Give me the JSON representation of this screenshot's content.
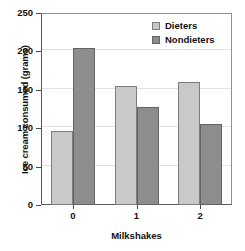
{
  "chart_data": {
    "type": "bar",
    "title": "",
    "subtitle": "",
    "xlabel": "Milkshakes",
    "ylabel": "Ice cream consumed (grams)",
    "categories": [
      "0",
      "1",
      "2"
    ],
    "series": [
      {
        "name": "Dieters",
        "color": "#c9c9c9",
        "values": [
          96,
          155,
          160
        ]
      },
      {
        "name": "Nondieters",
        "color": "#8d8d8d",
        "values": [
          205,
          128,
          105
        ]
      }
    ],
    "ylim": [
      0,
      250
    ],
    "yticks": [
      0,
      50,
      100,
      150,
      200,
      250
    ],
    "ytick_labels": [
      "0",
      "50",
      "100",
      "150",
      "200",
      "250"
    ],
    "xtick_labels": [
      "0",
      "1",
      "2"
    ],
    "grid": true,
    "legend_position": "top-right",
    "legend_entries": [
      "Dieters",
      "Nondieters"
    ]
  }
}
